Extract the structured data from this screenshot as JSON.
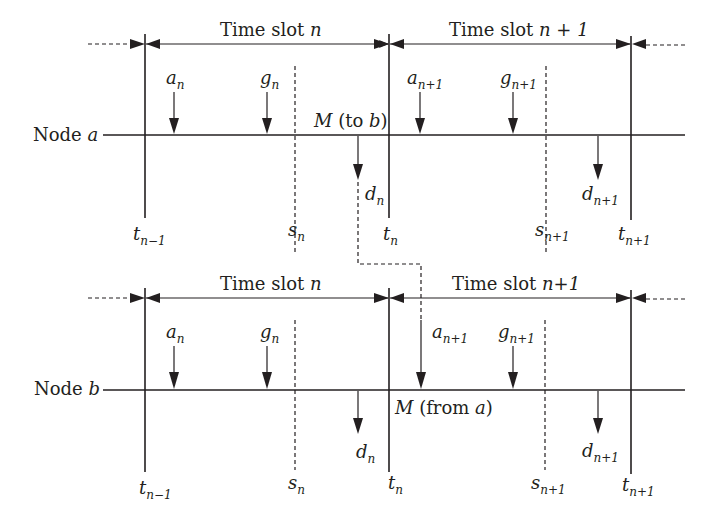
{
  "diagram": {
    "type": "timing-diagram",
    "nodes": [
      {
        "id": "a",
        "label": "Node",
        "var": "a",
        "slot_n_label": "Time slot",
        "slot_n_var": "n",
        "slot_n1_label": "Time slot",
        "slot_n1_var": "n + 1",
        "message_label_pre": "M",
        "message_label_post": "(to ",
        "message_target": "b",
        "message_close": ")"
      },
      {
        "id": "b",
        "label": "Node",
        "var": "b",
        "slot_n_label": "Time slot",
        "slot_n_var": "n",
        "slot_n1_label": "Time slot",
        "slot_n1_var": "n+1",
        "message_label_pre": "M",
        "message_label_post": "(from ",
        "message_target": "a",
        "message_close": ")"
      }
    ],
    "symbols": {
      "a": "a",
      "g": "g",
      "d": "d",
      "s": "s",
      "t": "t",
      "sub_n": "n",
      "sub_n1": "n+1",
      "sub_nm1": "n−1"
    }
  }
}
